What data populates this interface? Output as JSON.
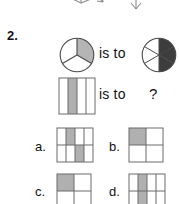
{
  "page": {
    "background": "#ffffff",
    "ink": "#1a1a1a"
  },
  "colors": {
    "outline": "#4a4a4a",
    "grid_line": "#6b6b6b",
    "shade_light": "#b5b5b5",
    "shade_dark": "#3d3d3d",
    "shade_grid": "#b0b0b0",
    "faint_outline": "#9a9a9a"
  },
  "previous_item": {
    "description": "cut-off line-drawn polyhedra from the item above",
    "shapes": [
      {
        "name": "cube-outline-partial"
      },
      {
        "name": "pyramid-outline-partial"
      }
    ]
  },
  "question": {
    "number": "2.",
    "analogy": {
      "row1": {
        "left_figure": {
          "name": "pie-three-sectors",
          "type": "pie",
          "sectors": 3,
          "shaded_indexes": [
            0
          ],
          "shade": "light"
        },
        "relation_text": "is to",
        "right_figure": {
          "name": "pie-six-sectors",
          "type": "pie",
          "sectors": 6,
          "shaded_indexes": [
            0,
            5
          ],
          "shade": "dark"
        }
      },
      "row2": {
        "left_figure": {
          "name": "square-four-vertical-strips",
          "type": "strips",
          "columns": 4,
          "shaded_indexes": [
            1
          ],
          "shade": "light"
        },
        "relation_text": "is to",
        "right_figure": {
          "name": "unknown-answer",
          "text": "?"
        }
      }
    },
    "options": [
      {
        "letter": "a.",
        "figure": {
          "name": "grid-4x2-two-shaded",
          "type": "grid",
          "columns": 4,
          "rows": 2,
          "shaded_cells": [
            [
              0,
              1
            ],
            [
              1,
              2
            ]
          ]
        }
      },
      {
        "letter": "b.",
        "figure": {
          "name": "grid-2x2-topleft-shaded",
          "type": "grid",
          "columns": 2,
          "rows": 2,
          "shaded_cells": [
            [
              0,
              0
            ]
          ]
        }
      },
      {
        "letter": "c.",
        "figure": {
          "name": "grid-2x2-topleft-shaded-cropped",
          "type": "grid",
          "columns": 2,
          "rows": 2,
          "shaded_cells": [
            [
              0,
              0
            ]
          ],
          "cropped": true
        }
      },
      {
        "letter": "d.",
        "figure": {
          "name": "grid-4col-second-shaded-cropped",
          "type": "grid",
          "columns": 4,
          "rows": 2,
          "shaded_cells": [
            [
              0,
              1
            ],
            [
              1,
              1
            ]
          ],
          "cropped": true
        }
      }
    ]
  }
}
